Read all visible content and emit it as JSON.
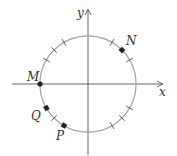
{
  "diagram": {
    "type": "unit-circle",
    "center": [
      88,
      84
    ],
    "radius": 48,
    "circle_color": "#a8a8a8",
    "axis_color": "#555555",
    "tick_color": "#444444",
    "point_color": "#222222",
    "axes": {
      "x_label": "x",
      "y_label": "y"
    },
    "tick_angles_deg": [
      30,
      60,
      120,
      135,
      150,
      225,
      300,
      315,
      330
    ],
    "points": [
      {
        "label": "N",
        "angle_deg": 45,
        "marker": "square"
      },
      {
        "label": "M",
        "angle_deg": 180,
        "marker": "circle"
      },
      {
        "label": "Q",
        "angle_deg": 210,
        "marker": "square"
      },
      {
        "label": "P",
        "angle_deg": 240,
        "marker": "square"
      }
    ]
  }
}
